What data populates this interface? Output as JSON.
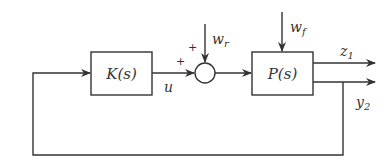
{
  "diagram": {
    "blocks": {
      "controller": {
        "label": "K(s)"
      },
      "plant": {
        "label": "P(s)"
      }
    },
    "summing_junction": {
      "signs": [
        "+",
        "+"
      ]
    },
    "signals": {
      "control": {
        "base": "u"
      },
      "reference_disturbance": {
        "base": "w",
        "sub": "r"
      },
      "force_disturbance": {
        "base": "w",
        "sub": "f"
      },
      "performance_output": {
        "base": "z",
        "sub": "1"
      },
      "measured_output": {
        "base": "y",
        "sub": "2"
      }
    },
    "colors": {
      "stroke": "#333333",
      "background": "#ffffff"
    }
  }
}
